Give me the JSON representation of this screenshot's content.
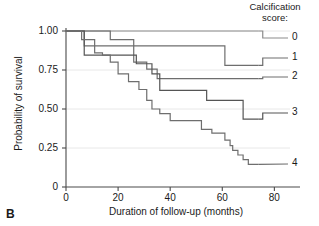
{
  "panel": {
    "label": "B"
  },
  "legend": {
    "title_line1": "Calcification",
    "title_line2": "score:",
    "entries": [
      {
        "label": "0",
        "y": 38
      },
      {
        "label": "1",
        "y": 58
      },
      {
        "label": "2",
        "y": 77
      },
      {
        "label": "3",
        "y": 113
      },
      {
        "label": "4",
        "y": 164
      }
    ]
  },
  "chart_data": {
    "type": "line",
    "subtype": "kaplan-meier-step",
    "title": "",
    "xlabel": "Duration of follow-up (months)",
    "ylabel": "Probability of survival",
    "xlim": [
      0,
      86
    ],
    "ylim": [
      0,
      1.0
    ],
    "xticks": [
      0,
      20,
      40,
      60,
      80
    ],
    "xtick_labels": [
      "0",
      "20",
      "40",
      "60",
      "80"
    ],
    "yticks": [
      0,
      0.25,
      0.5,
      0.75,
      1.0
    ],
    "ytick_labels": [
      "0",
      "0.25",
      "0.50",
      "0.75",
      "1.00"
    ],
    "grid": "horizontal",
    "legend_position": "right-outside",
    "legend_title": "Calcification score:",
    "series": [
      {
        "name": "0",
        "color": "#8c8c8c",
        "points": [
          [
            0,
            1.0
          ],
          [
            62,
            1.0
          ],
          [
            62,
            1.0
          ],
          [
            74,
            1.0
          ]
        ],
        "steps": [
          {
            "t": 0,
            "s": 1.0
          },
          {
            "t": 62,
            "s": 1.0
          },
          {
            "t": 74,
            "s": 1.0
          }
        ]
      },
      {
        "name": "1",
        "color": "#6e6e6e",
        "points": [
          [
            0,
            1.0
          ],
          [
            7,
            1.0
          ],
          [
            7,
            0.905
          ],
          [
            61,
            0.905
          ],
          [
            61,
            0.78
          ],
          [
            74,
            0.78
          ]
        ],
        "steps": [
          {
            "t": 0,
            "s": 1.0
          },
          {
            "t": 7,
            "s": 0.905
          },
          {
            "t": 61,
            "s": 0.78
          },
          {
            "t": 74,
            "s": 0.78
          }
        ]
      },
      {
        "name": "2",
        "color": "#6e6e6e",
        "points": [
          [
            0,
            1.0
          ],
          [
            17,
            1.0
          ],
          [
            17,
            0.945
          ],
          [
            26,
            0.945
          ],
          [
            26,
            0.8
          ],
          [
            31,
            0.8
          ],
          [
            31,
            0.755
          ],
          [
            35,
            0.755
          ],
          [
            35,
            0.695
          ],
          [
            74,
            0.695
          ]
        ],
        "steps": [
          {
            "t": 0,
            "s": 1.0
          },
          {
            "t": 17,
            "s": 0.945
          },
          {
            "t": 26,
            "s": 0.8
          },
          {
            "t": 31,
            "s": 0.755
          },
          {
            "t": 35,
            "s": 0.695
          },
          {
            "t": 74,
            "s": 0.695
          }
        ]
      },
      {
        "name": "3",
        "color": "#555555",
        "points": [
          [
            0,
            1.0
          ],
          [
            7,
            1.0
          ],
          [
            7,
            0.845
          ],
          [
            27,
            0.845
          ],
          [
            27,
            0.79
          ],
          [
            33,
            0.79
          ],
          [
            33,
            0.725
          ],
          [
            36,
            0.725
          ],
          [
            36,
            0.62
          ],
          [
            54,
            0.62
          ],
          [
            54,
            0.555
          ],
          [
            68,
            0.555
          ],
          [
            68,
            0.435
          ],
          [
            74,
            0.435
          ]
        ],
        "steps": [
          {
            "t": 0,
            "s": 1.0
          },
          {
            "t": 7,
            "s": 0.845
          },
          {
            "t": 27,
            "s": 0.79
          },
          {
            "t": 33,
            "s": 0.725
          },
          {
            "t": 36,
            "s": 0.62
          },
          {
            "t": 54,
            "s": 0.555
          },
          {
            "t": 68,
            "s": 0.435
          },
          {
            "t": 74,
            "s": 0.435
          }
        ]
      },
      {
        "name": "4",
        "color": "#6e6e6e",
        "points": [
          [
            0,
            1.0
          ],
          [
            6,
            1.0
          ],
          [
            6,
            0.945
          ],
          [
            11,
            0.945
          ],
          [
            11,
            0.86
          ],
          [
            14,
            0.86
          ],
          [
            14,
            0.845
          ],
          [
            17,
            0.845
          ],
          [
            17,
            0.8
          ],
          [
            20,
            0.8
          ],
          [
            20,
            0.725
          ],
          [
            24,
            0.725
          ],
          [
            24,
            0.675
          ],
          [
            28,
            0.675
          ],
          [
            28,
            0.625
          ],
          [
            31,
            0.625
          ],
          [
            31,
            0.555
          ],
          [
            33,
            0.555
          ],
          [
            33,
            0.5
          ],
          [
            36,
            0.5
          ],
          [
            36,
            0.47
          ],
          [
            40,
            0.47
          ],
          [
            40,
            0.425
          ],
          [
            52,
            0.425
          ],
          [
            52,
            0.37
          ],
          [
            56,
            0.37
          ],
          [
            56,
            0.345
          ],
          [
            61,
            0.345
          ],
          [
            61,
            0.3
          ],
          [
            63,
            0.3
          ],
          [
            63,
            0.265
          ],
          [
            64,
            0.265
          ],
          [
            64,
            0.235
          ],
          [
            66,
            0.235
          ],
          [
            66,
            0.205
          ],
          [
            68,
            0.205
          ],
          [
            68,
            0.175
          ],
          [
            70,
            0.175
          ],
          [
            70,
            0.145
          ],
          [
            74,
            0.145
          ]
        ],
        "steps": [
          {
            "t": 0,
            "s": 1.0
          },
          {
            "t": 6,
            "s": 0.945
          },
          {
            "t": 11,
            "s": 0.86
          },
          {
            "t": 14,
            "s": 0.845
          },
          {
            "t": 17,
            "s": 0.8
          },
          {
            "t": 20,
            "s": 0.725
          },
          {
            "t": 24,
            "s": 0.675
          },
          {
            "t": 28,
            "s": 0.625
          },
          {
            "t": 31,
            "s": 0.555
          },
          {
            "t": 33,
            "s": 0.5
          },
          {
            "t": 36,
            "s": 0.47
          },
          {
            "t": 40,
            "s": 0.425
          },
          {
            "t": 52,
            "s": 0.37
          },
          {
            "t": 56,
            "s": 0.345
          },
          {
            "t": 61,
            "s": 0.3
          },
          {
            "t": 63,
            "s": 0.265
          },
          {
            "t": 64,
            "s": 0.235
          },
          {
            "t": 66,
            "s": 0.205
          },
          {
            "t": 68,
            "s": 0.175
          },
          {
            "t": 70,
            "s": 0.145
          },
          {
            "t": 74,
            "s": 0.145
          }
        ]
      }
    ],
    "colors": {
      "axis": "#4a4a4a",
      "grid": "#e8e8e8",
      "curve_light": "#8c8c8c",
      "curve_mid": "#6e6e6e",
      "curve_dark": "#555555",
      "text": "#1a1a1a"
    }
  }
}
